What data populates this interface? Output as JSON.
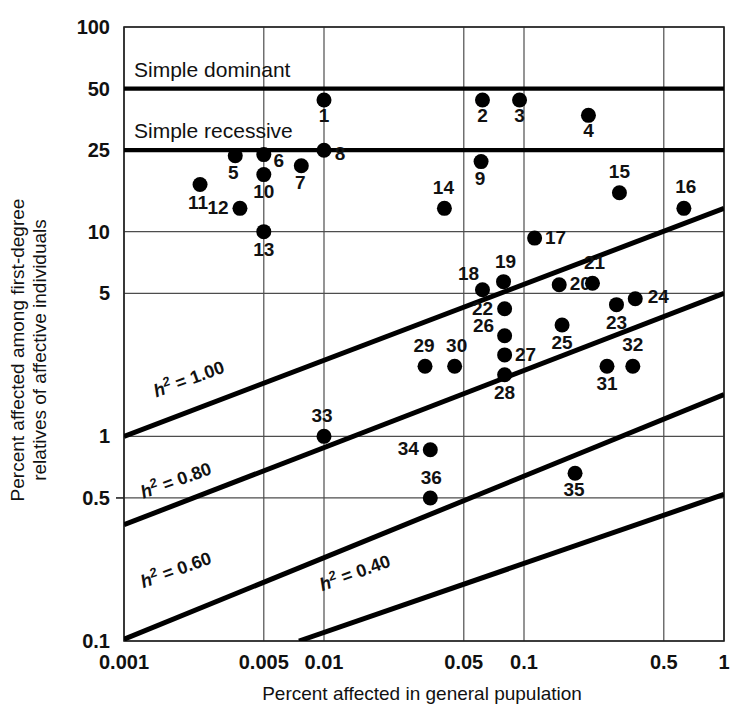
{
  "chart_data": {
    "type": "scatter",
    "title": "",
    "xlabel": "Percent affected in general pupulation",
    "ylabel": "Percent affected among first-degree relatives of affective individuals",
    "xscale": "log",
    "yscale": "log",
    "xlim": [
      0.001,
      1
    ],
    "ylim": [
      0.1,
      100
    ],
    "grid": true,
    "legend_position": "none",
    "xticks": [
      {
        "value": 0.001,
        "label": "0.001"
      },
      {
        "value": 0.005,
        "label": "0.005"
      },
      {
        "value": 0.01,
        "label": "0.01"
      },
      {
        "value": 0.05,
        "label": "0.05"
      },
      {
        "value": 0.1,
        "label": "0.1"
      },
      {
        "value": 0.5,
        "label": "0.5"
      },
      {
        "value": 1,
        "label": "1"
      }
    ],
    "yticks": [
      {
        "value": 100,
        "label": "100"
      },
      {
        "value": 50,
        "label": "50"
      },
      {
        "value": 25,
        "label": "25"
      },
      {
        "value": 10,
        "label": "10"
      },
      {
        "value": 5,
        "label": "5"
      },
      {
        "value": 1,
        "label": "1"
      },
      {
        "value": 0.5,
        "label": "0.5"
      },
      {
        "value": 0.1,
        "label": "0.1"
      }
    ],
    "reference_lines": [
      {
        "name": "simple-dominant",
        "label": "Simple dominant",
        "y": 50,
        "style": "thick-horizontal"
      },
      {
        "name": "simple-recessive",
        "label": "Simple recessive",
        "y": 25,
        "style": "thick-horizontal"
      }
    ],
    "heritability_lines": [
      {
        "name": "h2-1.00",
        "label": "h2 = 1.00",
        "label_prefix": "h",
        "label_exponent": "2",
        "label_suffix": " = 1.00",
        "value": 1.0,
        "x1": 0.001,
        "y1": 1.0,
        "x2": 1,
        "y2": 13.0
      },
      {
        "name": "h2-0.80",
        "label": "h2 = 0.80",
        "label_prefix": "h",
        "label_exponent": "2",
        "label_suffix": " = 0.80",
        "value": 0.8,
        "x1": 0.001,
        "y1": 0.37,
        "x2": 1,
        "y2": 5.0
      },
      {
        "name": "h2-0.60",
        "label": "h2 = 0.60",
        "label_prefix": "h",
        "label_exponent": "2",
        "label_suffix": " = 0.60",
        "value": 0.6,
        "x1": 0.001,
        "y1": 0.102,
        "x2": 1,
        "y2": 1.6
      },
      {
        "name": "h2-0.40",
        "label": "h2 = 0.40",
        "label_prefix": "h",
        "label_exponent": "2",
        "label_suffix": " = 0.40",
        "value": 0.4,
        "x1": 0.0075,
        "y1": 0.1,
        "x2": 1,
        "y2": 0.52
      }
    ],
    "points": [
      {
        "id": "1",
        "x": 0.01,
        "y": 44.0,
        "label": "1",
        "lx": 0,
        "ly": 22
      },
      {
        "id": "2",
        "x": 0.062,
        "y": 44.0,
        "label": "2",
        "lx": 0,
        "ly": 22
      },
      {
        "id": "3",
        "x": 0.095,
        "y": 44.0,
        "label": "3",
        "lx": 0,
        "ly": 22
      },
      {
        "id": "4",
        "x": 0.21,
        "y": 37.0,
        "label": "4",
        "lx": 0,
        "ly": 22
      },
      {
        "id": "5",
        "x": 0.0036,
        "y": 23.5,
        "label": "5",
        "lx": -2,
        "ly": 23
      },
      {
        "id": "6",
        "x": 0.005,
        "y": 23.8,
        "label": "6",
        "lx": 15,
        "ly": 12
      },
      {
        "id": "7",
        "x": 0.0077,
        "y": 21.0,
        "label": "7",
        "lx": -1,
        "ly": 23
      },
      {
        "id": "8",
        "x": 0.01,
        "y": 25.0,
        "label": "8",
        "lx": 16,
        "ly": 10
      },
      {
        "id": "9",
        "x": 0.061,
        "y": 22.0,
        "label": "9",
        "lx": -1,
        "ly": 23
      },
      {
        "id": "10",
        "x": 0.005,
        "y": 19.0,
        "label": "10",
        "lx": 0,
        "ly": 23
      },
      {
        "id": "11",
        "x": 0.0024,
        "y": 17.0,
        "label": "11",
        "lx": -2,
        "ly": 24
      },
      {
        "id": "12",
        "x": 0.0038,
        "y": 13.0,
        "label": "12",
        "lx": -22,
        "ly": 6
      },
      {
        "id": "13",
        "x": 0.005,
        "y": 10.0,
        "label": "13",
        "lx": 0,
        "ly": 24
      },
      {
        "id": "14",
        "x": 0.04,
        "y": 13.0,
        "label": "14",
        "lx": -1,
        "ly": -14
      },
      {
        "id": "15",
        "x": 0.3,
        "y": 15.5,
        "label": "15",
        "lx": 0,
        "ly": -15
      },
      {
        "id": "16",
        "x": 0.63,
        "y": 13.0,
        "label": "16",
        "lx": 2,
        "ly": -15
      },
      {
        "id": "17",
        "x": 0.113,
        "y": 9.3,
        "label": "17",
        "lx": 21,
        "ly": 6
      },
      {
        "id": "18",
        "x": 0.062,
        "y": 5.2,
        "label": "18",
        "lx": -14,
        "ly": -10
      },
      {
        "id": "19",
        "x": 0.079,
        "y": 5.7,
        "label": "19",
        "lx": 2,
        "ly": -14
      },
      {
        "id": "20",
        "x": 0.15,
        "y": 5.5,
        "label": "20",
        "lx": 21,
        "ly": 5
      },
      {
        "id": "21",
        "x": 0.22,
        "y": 5.6,
        "label": "21",
        "lx": 2,
        "ly": -14
      },
      {
        "id": "22",
        "x": 0.08,
        "y": 4.2,
        "label": "22",
        "lx": -22,
        "ly": 6
      },
      {
        "id": "23",
        "x": 0.29,
        "y": 4.4,
        "label": "23",
        "lx": 0,
        "ly": 24
      },
      {
        "id": "24",
        "x": 0.36,
        "y": 4.7,
        "label": "24",
        "lx": 23,
        "ly": 4
      },
      {
        "id": "25",
        "x": 0.155,
        "y": 3.5,
        "label": "25",
        "lx": 0,
        "ly": 24
      },
      {
        "id": "26",
        "x": 0.08,
        "y": 3.1,
        "label": "26",
        "lx": -21,
        "ly": -4
      },
      {
        "id": "27",
        "x": 0.08,
        "y": 2.5,
        "label": "27",
        "lx": 21,
        "ly": 6
      },
      {
        "id": "28",
        "x": 0.08,
        "y": 2.0,
        "label": "28",
        "lx": 0,
        "ly": 24
      },
      {
        "id": "29",
        "x": 0.032,
        "y": 2.2,
        "label": "29",
        "lx": -1,
        "ly": -14
      },
      {
        "id": "30",
        "x": 0.045,
        "y": 2.2,
        "label": "30",
        "lx": 2,
        "ly": -14
      },
      {
        "id": "31",
        "x": 0.26,
        "y": 2.2,
        "label": "31",
        "lx": 0,
        "ly": 24
      },
      {
        "id": "32",
        "x": 0.35,
        "y": 2.2,
        "label": "32",
        "lx": 0,
        "ly": -15
      },
      {
        "id": "33",
        "x": 0.01,
        "y": 1.0,
        "label": "33",
        "lx": -2,
        "ly": -14
      },
      {
        "id": "34",
        "x": 0.034,
        "y": 0.86,
        "label": "34",
        "lx": -22,
        "ly": 5
      },
      {
        "id": "35",
        "x": 0.18,
        "y": 0.66,
        "label": "35",
        "lx": -1,
        "ly": 23
      },
      {
        "id": "36",
        "x": 0.034,
        "y": 0.5,
        "label": "36",
        "lx": 1,
        "ly": -14
      }
    ]
  }
}
